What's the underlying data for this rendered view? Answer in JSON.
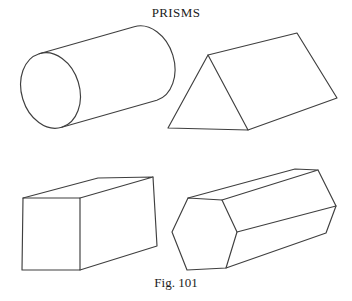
{
  "page": {
    "title": "PRISMS",
    "caption": "Fig. 101",
    "background": "#ffffff",
    "line_color": "#3f3f3f",
    "text_color": "#1c1c1c"
  },
  "figures": [
    {
      "name": "cylinder",
      "position": "top-left"
    },
    {
      "name": "triangular-prism",
      "position": "top-right"
    },
    {
      "name": "rectangular-prism",
      "position": "bottom-left"
    },
    {
      "name": "hexagonal-prism",
      "position": "bottom-right"
    }
  ]
}
